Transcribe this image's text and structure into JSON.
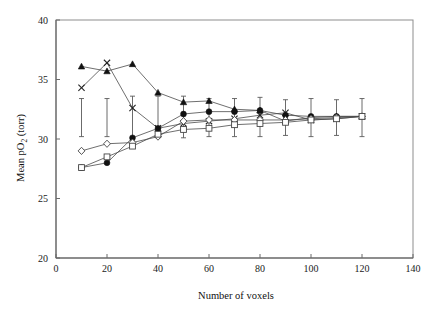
{
  "chart_data": {
    "type": "line",
    "title": "",
    "xlabel": "Number of voxels",
    "ylabel": "Mean pO2 (torr)",
    "ylabel_parts": {
      "pre": "Mean pO",
      "sub": "2",
      "post": " (torr)"
    },
    "xlim": [
      0,
      140
    ],
    "ylim": [
      20,
      40
    ],
    "xticks": [
      0,
      20,
      40,
      60,
      80,
      100,
      120,
      140
    ],
    "yticks": [
      20,
      25,
      30,
      35,
      40
    ],
    "xtick_labels": [
      "0",
      "20",
      "40",
      "60",
      "80",
      "100",
      "120",
      "140"
    ],
    "ytick_labels": [
      "20",
      "25",
      "30",
      "35",
      "40"
    ],
    "grid": false,
    "legend": "none",
    "x": [
      10,
      20,
      30,
      40,
      50,
      60,
      70,
      80,
      90,
      100,
      110,
      120
    ],
    "series": [
      {
        "name": "filled-triangle",
        "marker": "triangle-filled",
        "values": [
          36.1,
          35.7,
          36.3,
          33.9,
          33.1,
          33.2,
          32.5,
          32.4,
          31.5,
          31.8,
          31.9,
          31.9
        ]
      },
      {
        "name": "cross-x",
        "marker": "x",
        "values": [
          34.3,
          36.4,
          32.6,
          30.9,
          31.3,
          31.5,
          31.7,
          32.0,
          32.2,
          31.6,
          31.7,
          31.9
        ],
        "errors": [
          null,
          null,
          null,
          null,
          null,
          null,
          null,
          null,
          null,
          null,
          null,
          null
        ]
      },
      {
        "name": "filled-circle",
        "marker": "circle-filled",
        "values": [
          27.6,
          28.0,
          30.1,
          30.9,
          32.1,
          32.3,
          32.3,
          32.4,
          32.0,
          31.9,
          31.9,
          31.9
        ],
        "errors": [
          3.2,
          3.2,
          3.2,
          2.2,
          1.9,
          1.9,
          1.8,
          1.8,
          1.8,
          1.8,
          1.8,
          1.8
        ]
      },
      {
        "name": "open-diamond",
        "marker": "diamond-open",
        "values": [
          29.0,
          29.6,
          29.7,
          30.2,
          31.5,
          31.6,
          31.6,
          31.6,
          31.6,
          31.7,
          31.8,
          31.9
        ]
      },
      {
        "name": "open-square",
        "marker": "square-open",
        "values": [
          27.6,
          28.5,
          29.4,
          30.4,
          30.8,
          30.9,
          31.2,
          31.3,
          31.4,
          31.6,
          31.7,
          31.9
        ]
      }
    ],
    "errorbar_x": [
      10,
      20,
      30,
      40,
      50,
      60,
      70,
      80,
      90,
      100,
      110,
      120
    ],
    "errorbar_center": [
      31.9,
      31.9,
      31.9,
      31.9,
      31.9,
      31.9,
      31.9,
      31.9,
      31.9,
      31.9,
      31.9,
      31.9
    ],
    "errorbar_top": [
      33.4,
      33.4,
      33.6,
      33.6,
      33.6,
      33.4,
      33.4,
      33.5,
      33.3,
      33.4,
      33.3,
      33.4
    ],
    "errorbar_bottom": [
      30.2,
      30.2,
      29.9,
      30.1,
      30.1,
      30.2,
      30.2,
      30.2,
      30.3,
      30.2,
      30.3,
      30.2
    ]
  },
  "colors": {
    "frame": "#8d8d8d",
    "marker_fill": "#111111",
    "marker_open": "#ffffff",
    "line": "#4a4a4a",
    "text": "#111111",
    "background": "#ffffff"
  }
}
